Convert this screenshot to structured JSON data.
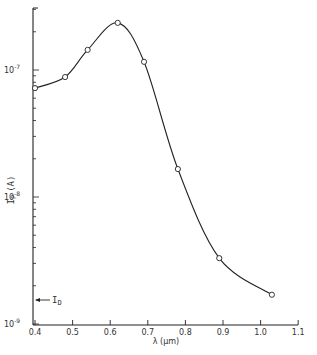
{
  "chart_data": {
    "type": "line",
    "title": "",
    "xlabel": "λ (μm)",
    "ylabel": "I_P (A)",
    "xlim": [
      0.4,
      1.1
    ],
    "ylim": [
      1e-09,
      3e-07
    ],
    "yscale": "log",
    "grid": false,
    "legend": null,
    "x_ticks": [
      "0.4",
      "0.5",
      "0.6",
      "0.7",
      "0.8",
      "0.9",
      "1.0",
      "1.1"
    ],
    "y_ticks": [
      "10^-9",
      "10^-8",
      "10^-7"
    ],
    "series": [
      {
        "name": "I_P",
        "marker": "open-circle",
        "x": [
          0.4,
          0.48,
          0.54,
          0.62,
          0.69,
          0.78,
          0.89,
          1.03
        ],
        "y": [
          7.2e-08,
          8.8e-08,
          1.44e-07,
          2.35e-07,
          1.16e-07,
          1.66e-08,
          3.3e-09,
          1.7e-09
        ]
      }
    ],
    "annotations": [
      {
        "text": "I_D",
        "x": 0.4,
        "y": 1.55e-09,
        "arrow": "pointing to y-axis"
      }
    ]
  },
  "labels": {
    "x_axis": "λ (μm)",
    "y_axis_main": "I",
    "y_axis_sub": "P",
    "y_axis_unit": "(A)",
    "annotation_main": "I",
    "annotation_sub": "D",
    "y_ticks": [
      {
        "base": "10",
        "exp": "-7"
      },
      {
        "base": "10",
        "exp": "-8"
      },
      {
        "base": "10",
        "exp": "-9"
      }
    ],
    "x_ticks": [
      "0.4",
      "0.5",
      "0.6",
      "0.7",
      "0.8",
      "0.9",
      "1.0",
      "1.1"
    ]
  }
}
